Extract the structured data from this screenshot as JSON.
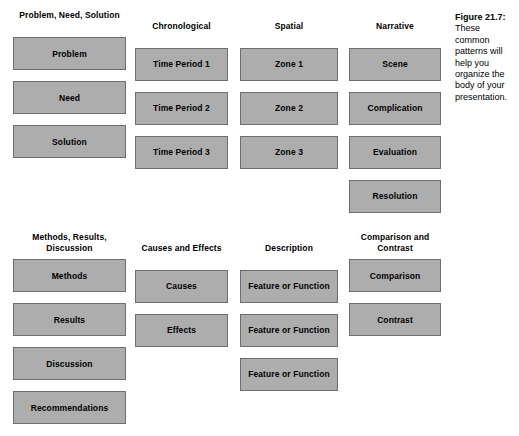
{
  "figure": {
    "caption_label": "Figure 21.7:",
    "caption_body": "These common patterns will help you organize the body of your presentation."
  },
  "colors": {
    "box_fill": "#adadad",
    "box_border": "#6e6e6e",
    "page_background": "#ffffff",
    "text": "#000000"
  },
  "sections": [
    {
      "id": "upper",
      "columns": [
        {
          "header": "Problem, Need, Solution",
          "boxes": [
            "Problem",
            "Need",
            "Solution"
          ]
        },
        {
          "header": "Chronological",
          "boxes": [
            "Time Period 1",
            "Time Period 2",
            "Time Period 3"
          ]
        },
        {
          "header": "Spatial",
          "boxes": [
            "Zone 1",
            "Zone 2",
            "Zone 3"
          ]
        },
        {
          "header": "Narrative",
          "boxes": [
            "Scene",
            "Complication",
            "Evaluation",
            "Resolution"
          ]
        }
      ]
    },
    {
      "id": "lower",
      "columns": [
        {
          "header": "Methods, Results, Discussion",
          "boxes": [
            "Methods",
            "Results",
            "Discussion",
            "Recommendations"
          ]
        },
        {
          "header": "Causes and Effects",
          "boxes": [
            "Causes",
            "Effects"
          ]
        },
        {
          "header": "Description",
          "boxes": [
            "Feature or Function",
            "Feature or Function",
            "Feature or Function"
          ]
        },
        {
          "header": "Comparison and Contrast",
          "boxes": [
            "Comparison",
            "Contrast"
          ]
        }
      ]
    }
  ]
}
